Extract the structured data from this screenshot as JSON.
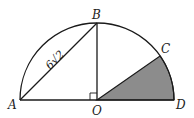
{
  "diagram": {
    "type": "semicircle geometry figure",
    "points": {
      "A": {
        "label": "A"
      },
      "B": {
        "label": "B"
      },
      "C": {
        "label": "C"
      },
      "O": {
        "label": "O"
      },
      "D": {
        "label": "D"
      }
    },
    "segments": [
      "AB",
      "BO",
      "AD",
      "OC"
    ],
    "measurements": {
      "AB": {
        "label": "6√2",
        "coef": "6",
        "radicand": "2"
      }
    },
    "right_angle_at": "O",
    "shaded_region": "sector COD",
    "colors": {
      "stroke": "#1a1a1a",
      "shade": "#8c8c8c"
    }
  }
}
